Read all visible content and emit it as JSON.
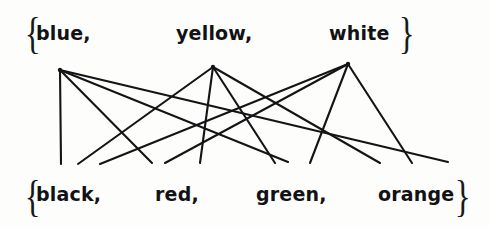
{
  "figure": {
    "background_color": "#fdfdfb",
    "ink_color": "#141416",
    "width": 490,
    "height": 227
  },
  "top_set": {
    "open_brace": "{",
    "close_brace": "}",
    "members": [
      {
        "label": "blue,",
        "x": 36,
        "y": 22,
        "vertex_x": 60,
        "vertex_y": 70
      },
      {
        "label": "yellow,",
        "x": 176,
        "y": 22,
        "vertex_x": 213,
        "vertex_y": 67
      },
      {
        "label": "white",
        "x": 329,
        "y": 22,
        "vertex_x": 348,
        "vertex_y": 64
      }
    ],
    "brace_left_x": 22,
    "brace_right_x": 396,
    "brace_y": 12
  },
  "bottom_set": {
    "open_brace": "{",
    "close_brace": "}",
    "members": [
      {
        "label": "black,",
        "x": 36,
        "y": 186,
        "vertex_x": 62,
        "vertex_y": 166
      },
      {
        "label": "red,",
        "x": 155,
        "y": 186,
        "vertex_x": 165,
        "vertex_y": 166
      },
      {
        "label": "green,",
        "x": 256,
        "y": 186,
        "vertex_x": 278,
        "vertex_y": 166
      },
      {
        "label": "orange",
        "x": 378,
        "y": 186,
        "vertex_x": 405,
        "vertex_y": 166
      }
    ],
    "brace_left_x": 22,
    "brace_right_x": 452,
    "brace_y": 176
  },
  "chart_data": {
    "type": "diagram",
    "diagram_kind": "bipartite-relation",
    "top_nodes": [
      "blue",
      "yellow",
      "white"
    ],
    "bottom_nodes": [
      "black",
      "red",
      "green",
      "orange"
    ],
    "edges": [
      {
        "from": "blue",
        "to": "black",
        "x1": 60,
        "y1": 70,
        "x2": 61,
        "y2": 164
      },
      {
        "from": "blue",
        "to": "red",
        "x1": 60,
        "y1": 70,
        "x2": 152,
        "y2": 163
      },
      {
        "from": "blue",
        "to": "green",
        "x1": 60,
        "y1": 70,
        "x2": 288,
        "y2": 162
      },
      {
        "from": "blue",
        "to": "orange",
        "x1": 60,
        "y1": 70,
        "x2": 448,
        "y2": 162
      },
      {
        "from": "yellow",
        "to": "black",
        "x1": 213,
        "y1": 67,
        "x2": 78,
        "y2": 164
      },
      {
        "from": "yellow",
        "to": "red",
        "x1": 213,
        "y1": 67,
        "x2": 200,
        "y2": 163
      },
      {
        "from": "yellow",
        "to": "green",
        "x1": 213,
        "y1": 67,
        "x2": 275,
        "y2": 163
      },
      {
        "from": "yellow",
        "to": "orange",
        "x1": 213,
        "y1": 67,
        "x2": 380,
        "y2": 163
      },
      {
        "from": "white",
        "to": "black",
        "x1": 348,
        "y1": 64,
        "x2": 100,
        "y2": 164
      },
      {
        "from": "white",
        "to": "red",
        "x1": 348,
        "y1": 64,
        "x2": 165,
        "y2": 163
      },
      {
        "from": "white",
        "to": "green",
        "x1": 348,
        "y1": 64,
        "x2": 310,
        "y2": 163
      },
      {
        "from": "white",
        "to": "orange",
        "x1": 348,
        "y1": 64,
        "x2": 412,
        "y2": 163
      }
    ],
    "edge_count": 12,
    "title": "",
    "xlabel": "",
    "ylabel": "",
    "legend": []
  }
}
